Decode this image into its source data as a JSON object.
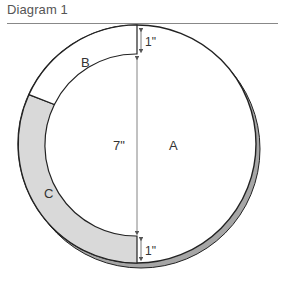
{
  "title": "Diagram 1",
  "diagram": {
    "regions": {
      "A": "A",
      "B": "B",
      "C": "C"
    },
    "dimensions": {
      "top_gap": "1\"",
      "diameter": "7\"",
      "bottom_gap": "1\""
    },
    "colors": {
      "stroke": "#222222",
      "region_c_fill": "#d9d9d9",
      "shadow_fill": "#a6a6a6",
      "dimension_line": "#666666",
      "rule": "#888888"
    }
  }
}
